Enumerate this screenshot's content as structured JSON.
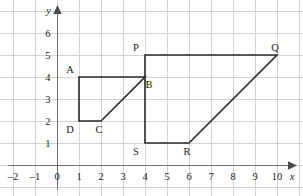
{
  "figure": {
    "background_color": "#ffffff",
    "grid_color": "#d3d3d3",
    "axis_color": "#6e6e6e",
    "shape_color": "#2b2b2b",
    "label_color": "#1a1a1a"
  },
  "axes": {
    "x_axis_name": "x",
    "y_axis_name": "y",
    "x_tick_labels": [
      "–2",
      "–1",
      "0",
      "1",
      "2",
      "3",
      "4",
      "5",
      "6",
      "7",
      "8",
      "9",
      "10"
    ],
    "x_tick_values": [
      -2,
      -1,
      0,
      1,
      2,
      3,
      4,
      5,
      6,
      7,
      8,
      9,
      10
    ],
    "y_tick_labels": [
      "1",
      "2",
      "3",
      "4",
      "5",
      "6"
    ],
    "y_tick_values": [
      1,
      2,
      3,
      4,
      5,
      6
    ]
  },
  "chart_data": {
    "type": "scatter",
    "title": "",
    "xlabel": "x",
    "ylabel": "y",
    "xlim": [
      -2.55,
      11.2
    ],
    "ylim": [
      -1.4,
      7.1
    ],
    "grid": true,
    "grid_spacing": 1,
    "legend": "none",
    "annotations": [
      "Quadrilateral ABCD with vertices A(1,4), B(4,4), C(2,2), D(1,2)",
      "Quadrilateral PQRS with vertices P(4,5), Q(10,5), R(6,1), S(4,1)"
    ],
    "shapes": [
      {
        "name": "ABCD",
        "closed": true,
        "points": [
          {
            "label": "A",
            "x": 1,
            "y": 4,
            "label_dx": -9,
            "label_dy": -4
          },
          {
            "label": "B",
            "x": 4,
            "y": 4,
            "label_dx": 4,
            "label_dy": 11
          },
          {
            "label": "C",
            "x": 2,
            "y": 2,
            "label_dx": -2,
            "label_dy": 12
          },
          {
            "label": "D",
            "x": 1,
            "y": 2,
            "label_dx": -9,
            "label_dy": 12
          }
        ]
      },
      {
        "name": "PQRS",
        "closed": true,
        "points": [
          {
            "label": "P",
            "x": 4,
            "y": 5,
            "label_dx": -9,
            "label_dy": -4
          },
          {
            "label": "Q",
            "x": 10,
            "y": 5,
            "label_dx": -2,
            "label_dy": -4
          },
          {
            "label": "R",
            "x": 6,
            "y": 1,
            "label_dx": -2,
            "label_dy": 12
          },
          {
            "label": "S",
            "x": 4,
            "y": 1,
            "label_dx": -9,
            "label_dy": 12
          }
        ]
      }
    ]
  }
}
